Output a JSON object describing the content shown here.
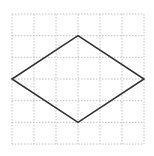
{
  "figure": {
    "type": "grid-diagram",
    "grid": {
      "columns": 6,
      "rows": 6,
      "origin_px": [
        12,
        14
      ],
      "cell_px": [
        22,
        21.67
      ],
      "line_color": "#c4c4c4",
      "line_style": "dotted"
    },
    "shape": {
      "kind": "rhombus",
      "stroke_color": "#333333",
      "stroke_width": 1.6,
      "fill": "none",
      "vertices_grid": [
        [
          3,
          1
        ],
        [
          6,
          3
        ],
        [
          3,
          5
        ],
        [
          0,
          3
        ]
      ]
    }
  }
}
